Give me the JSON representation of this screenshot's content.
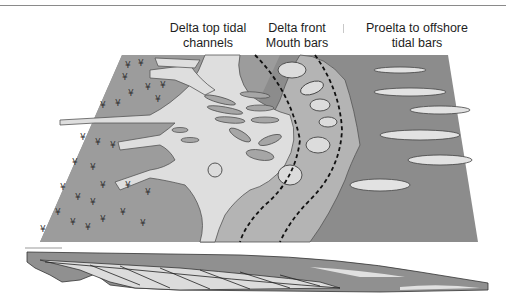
{
  "diagram": {
    "labels": [
      {
        "id": "delta-top",
        "lines": [
          "Delta top tidal",
          "channels"
        ]
      },
      {
        "id": "delta-front",
        "lines": [
          "Delta front",
          "Mouth bars"
        ]
      },
      {
        "id": "prodelta",
        "lines": [
          "Proelta to offshore",
          "tidal bars"
        ]
      }
    ],
    "zones": [
      {
        "name": "vegetated-delta-plain",
        "color": "#9a9a9a"
      },
      {
        "name": "tidal-channels",
        "color": "#dedede"
      },
      {
        "name": "delta-front",
        "color": "#b4b4b4"
      },
      {
        "name": "prodelta-offshore",
        "color": "#8c8c8c"
      },
      {
        "name": "offshore-tidal-bars",
        "color": "#e2e2e2"
      }
    ],
    "offshore_bar_count": 5,
    "cross_section": "present"
  }
}
